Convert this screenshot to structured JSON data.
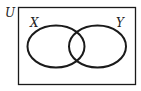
{
  "diagram": {
    "type": "venn",
    "universe_label": "U",
    "sets": [
      {
        "label": "X"
      },
      {
        "label": "Y"
      }
    ],
    "colors": {
      "stroke": "#1a1a1a",
      "background": "#ffffff"
    }
  }
}
